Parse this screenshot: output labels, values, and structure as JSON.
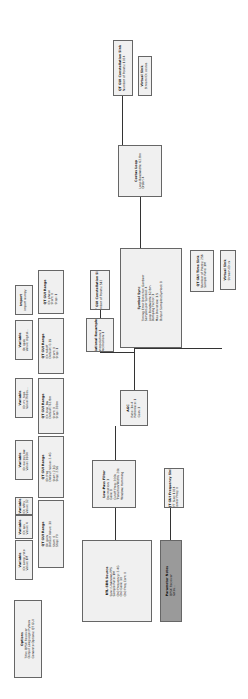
{
  "flowgraph": {
    "blocks": [
      {
        "id": "options",
        "title": "Options",
        "lines": [
          "Title: QPSK Receiver",
          "Output Language: Python",
          "Generate Options: QT GUI"
        ],
        "x": 14,
        "y": 600,
        "w": 28,
        "h": 78
      },
      {
        "id": "var1",
        "title": "Variable",
        "lines": [
          "ID: samp_rate",
          "Value: 1M"
        ],
        "x": 15,
        "y": 540,
        "w": 18,
        "h": 40
      },
      {
        "id": "range1",
        "title": "QT GUI Range",
        "lines": [
          "ID: gain",
          "Default Value: 30",
          "Start: 0",
          "Stop: 70"
        ],
        "x": 38,
        "y": 500,
        "w": 26,
        "h": 68
      },
      {
        "id": "var2",
        "title": "Variable",
        "lines": [
          "ID: sps",
          "Value: 4"
        ],
        "x": 15,
        "y": 515,
        "w": 18,
        "h": 24
      },
      {
        "id": "var3",
        "title": "Variable",
        "lines": [
          "ID: nfilts",
          "Value: 32"
        ],
        "x": 15,
        "y": 497,
        "w": 18,
        "h": 18
      },
      {
        "id": "range2",
        "title": "QT GUI Range",
        "lines": [
          "ID: freq",
          "Default Value: 2.4G",
          "Start: 2.3G",
          "Stop: 2.5G"
        ],
        "x": 38,
        "y": 436,
        "w": 26,
        "h": 62
      },
      {
        "id": "var4",
        "title": "Variable",
        "lines": [
          "ID: excess_bw",
          "Value: 350m"
        ],
        "x": 15,
        "y": 440,
        "w": 18,
        "h": 40
      },
      {
        "id": "range3",
        "title": "QT GUI Range",
        "lines": [
          "ID: loop_bw",
          "Default: 62.8m",
          "Start: 0",
          "Stop: 200m"
        ],
        "x": 38,
        "y": 378,
        "w": 26,
        "h": 56
      },
      {
        "id": "var5",
        "title": "Variable",
        "lines": [
          "ID: rrc_taps",
          "Value: firdes..."
        ],
        "x": 15,
        "y": 378,
        "w": 18,
        "h": 40
      },
      {
        "id": "range4",
        "title": "QT GUI Range",
        "lines": [
          "ID: rolloff",
          "Default: 0.35",
          "Start: 0",
          "Stop: 1"
        ],
        "x": 38,
        "y": 318,
        "w": 26,
        "h": 56
      },
      {
        "id": "var6",
        "title": "Variable",
        "lines": [
          "ID: qpsk",
          "Value: digital..."
        ],
        "x": 15,
        "y": 320,
        "w": 18,
        "h": 40
      },
      {
        "id": "range5",
        "title": "QT GUI Range",
        "lines": [
          "ID: phase",
          "Start: 0",
          "Stop: 1"
        ],
        "x": 38,
        "y": 270,
        "w": 26,
        "h": 44
      },
      {
        "id": "import",
        "title": "Import",
        "lines": [
          "import numpy"
        ],
        "x": 15,
        "y": 285,
        "w": 18,
        "h": 30
      },
      {
        "id": "src",
        "title": "RTL-SDR Source",
        "lines": [
          "Sync: Unknown PPS",
          "Sample Rate: 1M",
          "Ch0 Frequency: 2.4G",
          "Ch0 Gain: 30",
          "Ch0 Freq Corr: 0"
        ],
        "x": 82,
        "y": 540,
        "w": 70,
        "h": 82
      },
      {
        "id": "note",
        "title": "Parameter Notes",
        "lines": [
          "QPSK Receiver",
          "notes..."
        ],
        "x": 160,
        "y": 540,
        "w": 22,
        "h": 82,
        "dark": true
      },
      {
        "id": "lpf",
        "title": "Low-Pass Filter",
        "lines": [
          "Decimation: 1",
          "Gain: 1",
          "Cutoff Freq: 200k",
          "Transition Width: 20k",
          "Window: Hamming"
        ],
        "x": 92,
        "y": 460,
        "w": 44,
        "h": 48
      },
      {
        "id": "freqsink",
        "title": "QT GUI Frequency Sink",
        "lines": [
          "FFT Size: 1024",
          "Center Freq: 0"
        ],
        "x": 164,
        "y": 468,
        "w": 20,
        "h": 40
      },
      {
        "id": "agc",
        "title": "AGC",
        "lines": [
          "Rate: 1e-4",
          "Reference: 1",
          "Gain: 1"
        ],
        "x": 120,
        "y": 390,
        "w": 28,
        "h": 36
      },
      {
        "id": "resamp",
        "title": "Rational Resampler",
        "lines": [
          "Interpolation: 1",
          "Decimation: 1"
        ],
        "x": 86,
        "y": 318,
        "w": 28,
        "h": 34
      },
      {
        "id": "const1",
        "title": "QT GUI Constellation Sink",
        "lines": [
          "Number of Points: 512"
        ],
        "x": 90,
        "y": 270,
        "w": 20,
        "h": 40
      },
      {
        "id": "symsync",
        "title": "Symbol Sync",
        "lines": [
          "Timing Error Detector: Gardner",
          "Samples per Symbol: 4",
          "Loop Bandwidth: 62.8m",
          "Damping Factor: 1",
          "Max Deviation: 1.5",
          "Output Samples/Symbol: 1"
        ],
        "x": 120,
        "y": 248,
        "w": 62,
        "h": 100
      },
      {
        "id": "timesink",
        "title": "QT GUI Time Sink",
        "lines": [
          "Number of Points: 256",
          "Sample Rate: 1M"
        ],
        "x": 190,
        "y": 250,
        "w": 24,
        "h": 42
      },
      {
        "id": "virtsink",
        "title": "Virtual Sink",
        "lines": [
          "Stream ID: rx"
        ],
        "x": 220,
        "y": 250,
        "w": 16,
        "h": 40
      },
      {
        "id": "costas",
        "title": "Costas Loop",
        "lines": [
          "Loop Bandwidth: 62.8m",
          "Order: 4"
        ],
        "x": 118,
        "y": 145,
        "w": 44,
        "h": 52
      },
      {
        "id": "const2",
        "title": "QT GUI Constellation Sink",
        "lines": [
          "Number of Points: 1024"
        ],
        "x": 113,
        "y": 40,
        "w": 20,
        "h": 56
      },
      {
        "id": "virtsink2",
        "title": "Virtual Sink",
        "lines": [
          "Stream ID: costas"
        ],
        "x": 138,
        "y": 56,
        "w": 14,
        "h": 40
      }
    ]
  }
}
